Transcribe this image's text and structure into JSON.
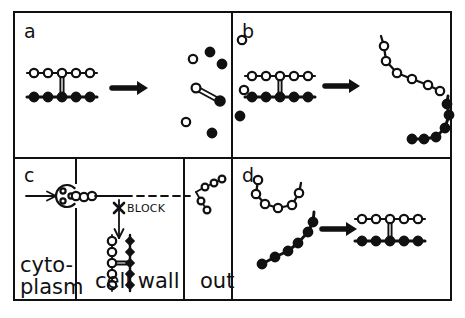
{
  "figure": {
    "type": "scientific-diagram",
    "background_color": "#ffffff",
    "ink_color": "#111111",
    "width": 465,
    "height": 318,
    "frame": {
      "x": 14,
      "y": 12,
      "width": 437,
      "height": 288,
      "stroke_width": 2
    },
    "divider_horizontal_y": 158,
    "divider_vertical_x": 232
  },
  "panels": [
    {
      "id": "a",
      "label": "a",
      "label_x": 24,
      "label_y": 38,
      "description": "paired open/filled chain dissociating into dispersed free subunits",
      "arrow": {
        "x1": 112,
        "y1": 88,
        "x2": 148,
        "y2": 88
      },
      "duplex": {
        "x": 34,
        "top_y": 73,
        "bottom_y": 97,
        "count": 5,
        "spacing": 14,
        "top_marker": "open-circle",
        "bottom_marker": "filled-circle",
        "crosslink_index": 2,
        "crosslink_style": "double-vertical-line"
      },
      "scatter": [
        {
          "marker": "open-circle",
          "x": 193,
          "y": 59
        },
        {
          "marker": "filled-circle",
          "x": 210,
          "y": 52
        },
        {
          "marker": "filled-circle",
          "x": 222,
          "y": 64
        },
        {
          "marker": "open-circle",
          "x": 242,
          "y": 40
        },
        {
          "marker": "open-circle",
          "x": 244,
          "y": 90
        },
        {
          "marker": "filled-circle",
          "x": 240,
          "y": 116
        },
        {
          "marker": "open-circle",
          "x": 186,
          "y": 122
        },
        {
          "marker": "filled-circle",
          "x": 212,
          "y": 133
        }
      ],
      "dimer": {
        "open_x": 196,
        "open_y": 88,
        "filled_x": 220,
        "filled_y": 101,
        "bond_style": "double-line"
      }
    },
    {
      "id": "b",
      "label": "b",
      "label_x": 242,
      "label_y": 38,
      "description": "paired chain separating into two intact curved strands",
      "arrow": {
        "x1": 325,
        "y1": 86,
        "x2": 360,
        "y2": 86
      },
      "duplex": {
        "x": 252,
        "top_y": 76,
        "bottom_y": 97,
        "count": 5,
        "spacing": 14,
        "top_marker": "open-circle",
        "bottom_marker": "filled-circle",
        "crosslink_index": 2,
        "crosslink_style": "double-vertical-line"
      },
      "strand_open": {
        "marker": "open-circle",
        "points": [
          [
            384,
            46
          ],
          [
            386,
            61
          ],
          [
            397,
            73
          ],
          [
            412,
            79
          ],
          [
            428,
            85
          ],
          [
            440,
            91
          ]
        ],
        "tail": [
          [
            381,
            36
          ],
          [
            384,
            46
          ]
        ]
      },
      "strand_filled": {
        "marker": "filled-circle",
        "points": [
          [
            412,
            139
          ],
          [
            424,
            139
          ],
          [
            436,
            137
          ],
          [
            445,
            128
          ],
          [
            449,
            115
          ],
          [
            447,
            104
          ]
        ],
        "tail": [
          [
            447,
            104
          ],
          [
            448,
            96
          ]
        ]
      }
    },
    {
      "id": "c",
      "label": "c",
      "label_x": 24,
      "label_y": 182,
      "description": "transport across compartments with an export BLOCK",
      "compartments": [
        {
          "name": "cytoplasm",
          "label_lines": [
            "cyto-",
            "plasm"
          ],
          "x": 18,
          "label_x": 20,
          "label_y": 272,
          "width": 58
        },
        {
          "name": "cell-wall",
          "label_lines": [
            "cell wall"
          ],
          "x": 78,
          "label_x": 95,
          "label_y": 288,
          "width": 106
        },
        {
          "name": "out",
          "label_lines": [
            "out"
          ],
          "x": 186,
          "label_x": 200,
          "label_y": 288,
          "width": 62
        }
      ],
      "wall_boundaries_x": [
        76,
        184
      ],
      "entry_arrow": {
        "x1": 26,
        "y1": 196,
        "x2": 56,
        "y2": 196
      },
      "exporter": {
        "name": "membrane-channel",
        "cx": 67,
        "cy": 196,
        "r": 11,
        "shape": "c-shape-open-right",
        "inner_dots": [
          [
            63,
            191
          ],
          [
            63,
            201
          ],
          [
            71,
            196
          ]
        ]
      },
      "nascent_chain": {
        "marker": "open-circle",
        "points": [
          [
            76,
            196
          ],
          [
            84,
            197
          ],
          [
            92,
            196
          ]
        ]
      },
      "transport_line": {
        "x1": 95,
        "y1": 196,
        "x2": 190,
        "y2": 196,
        "dashed_from_x": 125
      },
      "block": {
        "label": "BLOCK",
        "marker": "x-cross",
        "x": 119,
        "y": 208,
        "label_x": 127,
        "label_y": 212
      },
      "down_arrow": {
        "x1": 119,
        "y1": 200,
        "x2": 119,
        "y2": 238
      },
      "wall_duplex": {
        "orientation": "vertical",
        "left_x": 112,
        "right_x": 130,
        "y_start": 241,
        "count": 5,
        "spacing": 11,
        "left_marker": "open-circle",
        "right_marker": "filled-diamond",
        "crosslink_index": 2,
        "crosslink_style": "double-horizontal-line"
      },
      "released_product": {
        "marker": "open-circle",
        "branch_point": [
          196,
          192
        ],
        "branch_a": [
          [
            196,
            192
          ],
          [
            205,
            187
          ],
          [
            214,
            183
          ],
          [
            222,
            179
          ]
        ],
        "branch_b": [
          [
            196,
            192
          ],
          [
            201,
            201
          ],
          [
            207,
            210
          ]
        ]
      }
    },
    {
      "id": "d",
      "label": "d",
      "label_x": 242,
      "label_y": 182,
      "description": "two separate curved strands reassembling into the paired chain",
      "arrow": {
        "x1": 322,
        "y1": 229,
        "x2": 357,
        "y2": 229
      },
      "strand_open": {
        "marker": "open-circle",
        "points": [
          [
            258,
            180
          ],
          [
            256,
            194
          ],
          [
            265,
            204
          ],
          [
            278,
            208
          ],
          [
            292,
            205
          ],
          [
            299,
            193
          ]
        ],
        "tail": [
          [
            299,
            193
          ],
          [
            301,
            183
          ]
        ]
      },
      "strand_filled": {
        "marker": "filled-circle",
        "points": [
          [
            262,
            264
          ],
          [
            275,
            257
          ],
          [
            288,
            251
          ],
          [
            298,
            243
          ],
          [
            308,
            232
          ],
          [
            313,
            222
          ]
        ],
        "tail": [
          [
            313,
            222
          ],
          [
            314,
            212
          ]
        ]
      },
      "duplex": {
        "x": 362,
        "top_y": 219,
        "bottom_y": 241,
        "count": 5,
        "spacing": 14,
        "top_marker": "open-circle",
        "bottom_marker": "filled-circle",
        "crosslink_index": 2,
        "crosslink_style": "double-vertical-line"
      }
    }
  ],
  "legend": {
    "open_circle_meaning": "open-circle-subunit",
    "filled_circle_meaning": "filled-circle-subunit"
  }
}
